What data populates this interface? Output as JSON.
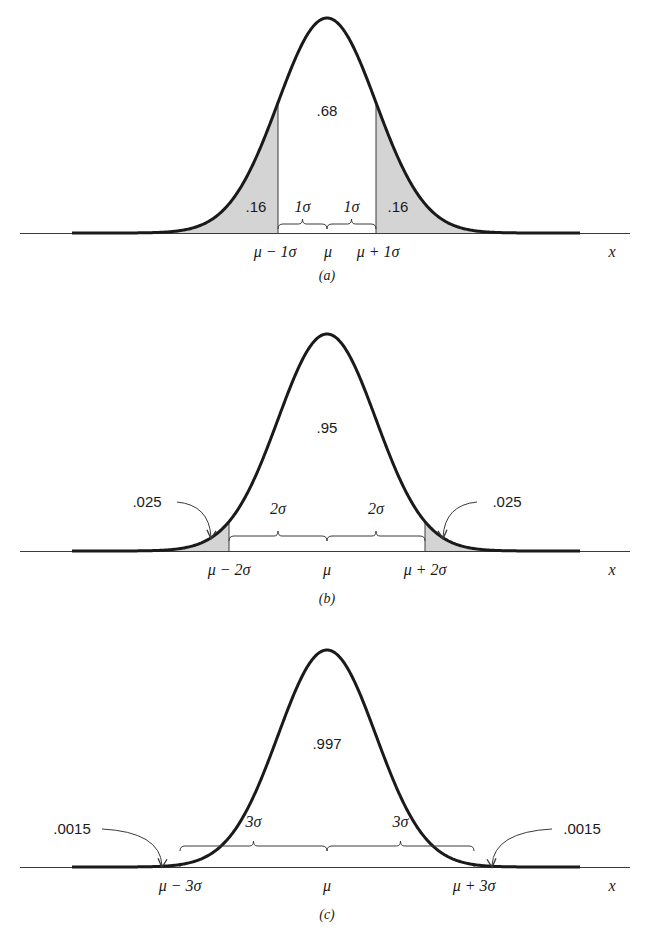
{
  "figure": {
    "axis_label": "x",
    "mean_label": "μ",
    "colors": {
      "curve": "#1a1a1a",
      "shade": "#d4d4d4",
      "axis": "#3a3a3a"
    }
  },
  "panels": [
    {
      "id": "a",
      "caption": "(a)",
      "k": 1,
      "center_area_label": ".68",
      "tail_area_label": ".16",
      "tail_label_style": "inside",
      "shaded": "tails",
      "sigma_brace_label": "1σ",
      "left_bound_label": "μ − 1σ",
      "right_bound_label": "μ + 1σ",
      "mean_label": "μ",
      "geom": {
        "baseline": 233,
        "peak": 18,
        "center_label_y": 116,
        "caption_y": 280,
        "axis_label_y": 257,
        "bound_label_y": 257,
        "brace_y": 224,
        "brace_label_y": 212,
        "tail_label_y": 212
      }
    },
    {
      "id": "b",
      "caption": "(b)",
      "k": 2,
      "center_area_label": ".95",
      "tail_area_label": ".025",
      "tail_label_style": "arrow",
      "shaded": "tails",
      "sigma_brace_label": "2σ",
      "left_bound_label": "μ − 2σ",
      "right_bound_label": "μ + 2σ",
      "mean_label": "μ",
      "geom": {
        "baseline": 551,
        "peak": 334,
        "center_label_y": 433,
        "caption_y": 603,
        "axis_label_y": 575,
        "bound_label_y": 575,
        "brace_y": 536,
        "brace_label_y": 514,
        "tail_label_y": 507
      }
    },
    {
      "id": "c",
      "caption": "(c)",
      "k": 3,
      "center_area_label": ".997",
      "tail_area_label": ".0015",
      "tail_label_style": "arrow",
      "shaded": "tails",
      "sigma_brace_label": "3σ",
      "left_bound_label": "μ − 3σ",
      "right_bound_label": "μ + 3σ",
      "mean_label": "μ",
      "geom": {
        "baseline": 867,
        "peak": 650,
        "center_label_y": 749,
        "caption_y": 919,
        "axis_label_y": 891,
        "bound_label_y": 891,
        "brace_y": 846,
        "brace_label_y": 827,
        "tail_label_y": 834
      }
    }
  ],
  "layout": {
    "mu_px": 327,
    "sigma_px": 49,
    "axis_x0": 20,
    "axis_x1": 630,
    "curve_x0": 72,
    "curve_x1": 580,
    "x_label_x": 612
  }
}
